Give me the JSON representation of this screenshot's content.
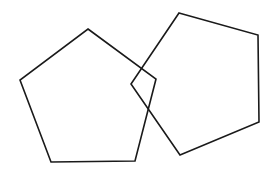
{
  "diagram": {
    "background": "#ffffff",
    "stroke_color": "#1a1a1a",
    "stroke_width": 1.6,
    "shapes": [
      {
        "name": "left-pentagon",
        "type": "pentagon",
        "points": "88,29 156,79 135,161 51,162 20,80"
      },
      {
        "name": "right-pentagon",
        "type": "pentagon",
        "points": "179,13 258,35 259,122 180,155 131,84"
      }
    ]
  }
}
